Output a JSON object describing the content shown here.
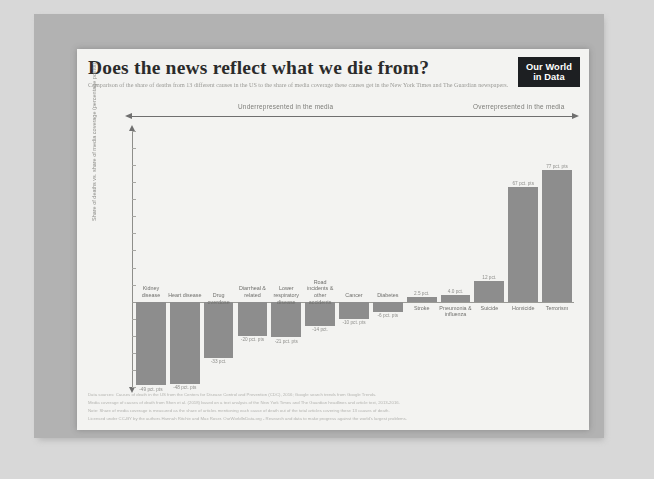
{
  "slide": {
    "background_color": "#b2b2b2",
    "card_color": "#f3f3f1"
  },
  "header": {
    "title": "Does the news reflect what we die from?",
    "subtitle": "Comparison of the share of deaths from 13 different causes in the US to the share of media coverage these causes get in the New York Times and The Guardian newspapers.",
    "logo_line1": "Our World",
    "logo_line2": "in Data"
  },
  "band": {
    "left_label": "Underrepresented in the media",
    "right_label": "Overrepresented in the media"
  },
  "footer": {
    "line1": "Data sources: Causes of death in the US from the Centers for Disease Control and Prevention (CDC), 2016; Google search trends from Google Trends.",
    "line2": "Media coverage of causes of death from Shen et al. (2018) based on a text analysis of the New York Times and The Guardian headlines and article text, 2013-2016.",
    "line3": "Note: Share of media coverage is measured as the share of articles mentioning each cause of death out of the total articles covering these 13 causes of death.",
    "line4": "Licensed under CC-BY by the authors Hannah Ritchie and Max Roser.   OurWorldInData.org - Research and data to make progress against the world's largest problems."
  },
  "chart_data": {
    "type": "bar",
    "title": "Does the news reflect what we die from?",
    "xlabel": "",
    "ylabel": "Share of deaths vs. share of media coverage (percentage points)",
    "ylim": [
      -50,
      100
    ],
    "yticks": [
      100,
      90,
      80,
      70,
      60,
      50,
      40,
      30,
      20,
      10,
      0,
      -10,
      -20,
      -30,
      -40,
      -50
    ],
    "ytick_labels": [
      "100%",
      "90",
      "80",
      "70",
      "60",
      "50",
      "40",
      "30",
      "20",
      "10",
      "0",
      "-10",
      "-20",
      "-30",
      "-40",
      "-50"
    ],
    "grid": false,
    "legend": false,
    "bar_color": "#8d8d8d",
    "categories": [
      "Kidney disease",
      "Heart disease",
      "Drug overdose",
      "Diarrheal & related",
      "Lower respiratory disease",
      "Road incidents & other accidents",
      "Cancer",
      "Diabetes",
      "Stroke",
      "Pneumonia & influenza",
      "Suicide",
      "Homicide",
      "Terrorism"
    ],
    "values": [
      -49,
      -48,
      -33,
      -20,
      -21,
      -14,
      -10,
      -6,
      2.5,
      4,
      12,
      67,
      77
    ],
    "value_labels": [
      "-49 pct. pts",
      "-48 pct. pts",
      "-33 pct.",
      "-20 pct. pts",
      "-21 pct. pts",
      "-14 pct.",
      "-10 pct. pts",
      "-6 pct. pts",
      "2.5 pct.",
      "4.0 pct.",
      "12 pct.",
      "67 pct. pts",
      "77 pct. pts"
    ],
    "annotations": {
      "left_direction": "Underrepresented in the media",
      "right_direction": "Overrepresented in the media",
      "clipped_bar": "Terrorism"
    }
  }
}
